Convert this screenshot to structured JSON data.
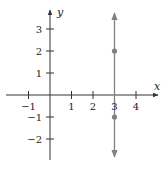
{
  "chart_data": {
    "type": "line",
    "title": "",
    "xlabel": "x",
    "ylabel": "y",
    "xlim": [
      -1.5,
      4.5
    ],
    "ylim": [
      -2.8,
      3.5
    ],
    "grid": false,
    "x_ticks": [
      -1,
      1,
      2,
      3,
      4
    ],
    "y_ticks": [
      3,
      2,
      1,
      -1,
      -2
    ],
    "x_tick_labels": [
      "−1",
      "1",
      "2",
      "3",
      "4"
    ],
    "y_tick_labels": [
      "3",
      "2",
      "1",
      "−1",
      "−2"
    ],
    "series": [
      {
        "name": "vertical line x = 3",
        "kind": "vertical-line",
        "x": 3,
        "arrows": "both",
        "color": "#808080"
      }
    ],
    "points": [
      {
        "x": 3,
        "y": 2,
        "color": "#808080"
      },
      {
        "x": 3,
        "y": -1,
        "color": "#808080"
      }
    ],
    "colors": {
      "axis": "#333333",
      "line": "#808080"
    }
  }
}
